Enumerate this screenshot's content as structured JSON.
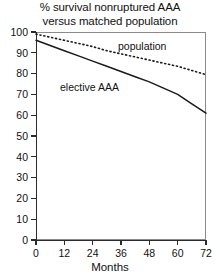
{
  "chart_data": {
    "type": "line",
    "title": "% survival nonruptured AAA versus matched population",
    "title_lines": [
      "% survival nonruptured AAA",
      "versus matched population"
    ],
    "xlabel": "Months",
    "ylabel": "",
    "xlim": [
      0,
      72
    ],
    "ylim": [
      0,
      100
    ],
    "xticks": [
      0,
      12,
      24,
      36,
      48,
      60,
      72
    ],
    "yticks": [
      0,
      10,
      20,
      30,
      40,
      50,
      60,
      70,
      80,
      90,
      100
    ],
    "grid": false,
    "legend_position": "inline-annotation",
    "x": [
      0,
      6,
      12,
      18,
      24,
      30,
      36,
      42,
      48,
      54,
      60,
      66,
      72
    ],
    "series": [
      {
        "name": "population",
        "label": "population",
        "style": "dotted",
        "color": "#1a1a1a",
        "values": [
          99,
          97.5,
          96,
          94.5,
          93,
          91,
          89.5,
          88,
          86.5,
          85,
          83.5,
          81.5,
          79.5
        ]
      },
      {
        "name": "elective AAA",
        "label": "elective AAA",
        "style": "solid",
        "color": "#1a1a1a",
        "values": [
          96,
          93.5,
          91,
          88.5,
          86,
          83.5,
          81,
          78.5,
          76,
          73,
          70,
          65.5,
          61
        ]
      }
    ],
    "annotations": [
      {
        "text": "population",
        "x_px": 118,
        "y_px": 41
      },
      {
        "text": "elective AAA",
        "x_px": 60,
        "y_px": 82
      }
    ]
  },
  "axis_labels": {
    "y": [
      "100",
      "90",
      "80",
      "70",
      "60",
      "50",
      "40",
      "30",
      "20",
      "10",
      "0"
    ],
    "x": [
      "0",
      "12",
      "24",
      "36",
      "48",
      "60",
      "72"
    ],
    "x_title": "Months"
  }
}
